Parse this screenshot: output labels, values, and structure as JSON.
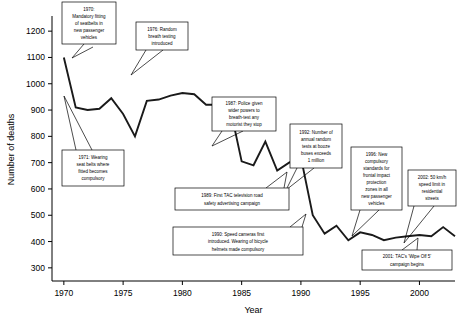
{
  "chart_data": {
    "type": "line",
    "title": "",
    "xlabel": "Year",
    "ylabel": "Number of deaths",
    "xlim": [
      1969,
      2003
    ],
    "ylim": [
      250,
      1250
    ],
    "grid": false,
    "legend": "none",
    "xticks": [
      "1970",
      "1975",
      "1980",
      "1985",
      "1990",
      "1995",
      "2000"
    ],
    "xtick_values": [
      1970,
      1975,
      1980,
      1985,
      1990,
      1995,
      2000
    ],
    "yticks": [
      "300",
      "400",
      "500",
      "600",
      "700",
      "800",
      "900",
      "1000",
      "1100",
      "1200"
    ],
    "ytick_values": [
      300,
      400,
      500,
      600,
      700,
      800,
      900,
      1000,
      1100,
      1200
    ],
    "series": [
      {
        "name": "Number of deaths",
        "color": "#1a1a1a",
        "x": [
          1970,
          1971,
          1972,
          1973,
          1974,
          1975,
          1976,
          1977,
          1978,
          1979,
          1980,
          1981,
          1982,
          1983,
          1984,
          1985,
          1986,
          1987,
          1988,
          1989,
          1990,
          1991,
          1992,
          1993,
          1994,
          1995,
          1996,
          1997,
          1998,
          1999,
          2000,
          2001,
          2002,
          2003
        ],
        "values": [
          1100,
          910,
          900,
          905,
          945,
          885,
          800,
          935,
          940,
          955,
          965,
          960,
          920,
          920,
          915,
          705,
          690,
          780,
          670,
          700,
          720,
          500,
          430,
          460,
          405,
          435,
          425,
          405,
          415,
          420,
          425,
          420,
          455,
          420
        ]
      }
    ],
    "annotations": [
      {
        "id": "ann-1970",
        "text": "1970: Mandatory fitting of seatbelts in new passenger vehicles",
        "year": 1970,
        "value": 1100
      },
      {
        "id": "ann-1971",
        "text": "1971: Wearing seat belts where fitted becomes compulsory",
        "year": 1971,
        "value": 910
      },
      {
        "id": "ann-1976",
        "text": "1976: Random breath testing introduced",
        "year": 1977,
        "value": 935
      },
      {
        "id": "ann-1987",
        "text": "1987: Police given wider powers to breath-test any motorist they stop",
        "year": 1987,
        "value": 780
      },
      {
        "id": "ann-1989",
        "text": "1989: First TAC television road safety advertising campaign",
        "year": 1989,
        "value": 700
      },
      {
        "id": "ann-1990",
        "text": "1990: Speed cameras first introduced. Wearing of bicycle helmets made compulsory",
        "year": 1990,
        "value": 720
      },
      {
        "id": "ann-1992",
        "text": "1992: Number of annual random tests at booze buses exceeds 1 million",
        "year": 1992,
        "value": 430
      },
      {
        "id": "ann-1996",
        "text": "1996: New compulsory standards for frontal impact protection zones in all new passenger vehicles",
        "year": 1996,
        "value": 425
      },
      {
        "id": "ann-2001",
        "text": "2001: TAC's 'Wipe Off 5' campaign begins",
        "year": 2001,
        "value": 420
      },
      {
        "id": "ann-2002",
        "text": "2002: 50 km/h speed limit in residential streets",
        "year": 2002,
        "value": 455
      }
    ]
  },
  "callouts": {
    "c1970": [
      "1970:",
      "Mandatory fitting",
      "of seatbelts in",
      "new passenger",
      "vehicles"
    ],
    "c1976": [
      "1976: Random",
      "breath testing",
      "introduced"
    ],
    "c1971": [
      "1971: Wearing",
      "seat belts where",
      "fitted becomes",
      "compulsory"
    ],
    "c1987": [
      "1987: Police given",
      "wider powers to",
      "breath-test any",
      "motorist they stop"
    ],
    "c1992": [
      "1992: Number of",
      "annual random",
      "tests at booze",
      "buses exceeds",
      "1 million"
    ],
    "c1996": [
      "1996: New",
      "compulsory",
      "standards for",
      "frontal impact",
      "protection",
      "zones in all",
      "new passenger",
      "vehicles"
    ],
    "c2002": [
      "2002: 50 km/h",
      "speed limit in",
      "residential",
      "streets"
    ],
    "c1989": [
      "1989: First TAC television road",
      "safety advertising campaign"
    ],
    "c1990": [
      "1990: Speed cameras first",
      "introduced. Wearing of bicycle",
      "helmets made compulsory"
    ],
    "c2001": [
      "2001: TAC's 'Wipe Off 5'",
      "campaign begins"
    ]
  }
}
